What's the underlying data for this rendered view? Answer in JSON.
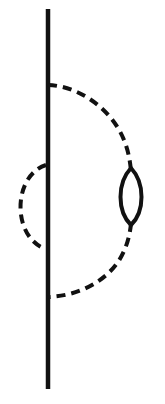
{
  "diagram": {
    "type": "feynman-diagram",
    "colors": {
      "background": "#ffffff",
      "line": "#111111"
    },
    "elements": {
      "fermion_line": {
        "style": "solid",
        "orientation": "vertical"
      },
      "outer_propagator": {
        "style": "dashed",
        "side": "right",
        "insertion": "fermion-loop"
      },
      "inner_propagator": {
        "style": "dashed",
        "side": "left"
      },
      "loop": {
        "style": "solid",
        "shape": "lens"
      }
    }
  }
}
